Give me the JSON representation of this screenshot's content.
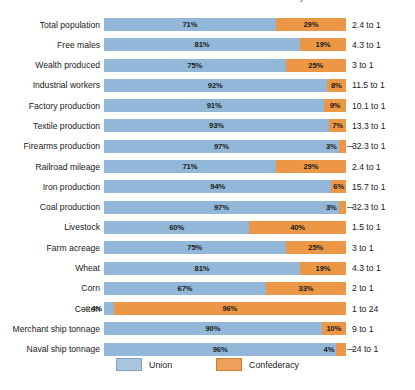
{
  "title": "Resources of the Union and the Confederacy",
  "legend": {
    "position": "bottom-center",
    "items": [
      {
        "label": "Union",
        "color": "#92b7d9",
        "key": "union"
      },
      {
        "label": "Confederacy",
        "color": "#eb9746",
        "key": "confederacy"
      }
    ]
  },
  "chart_data": {
    "type": "bar",
    "orientation": "horizontal",
    "stacked": true,
    "title": "Resources of the Union and the Confederacy",
    "xlabel": "",
    "ylabel": "",
    "xlim": [
      0,
      100
    ],
    "grid": false,
    "legend_position": "bottom-center",
    "value_unit": "percent",
    "categories": [
      "Total population",
      "Free males",
      "Wealth produced",
      "Industrial workers",
      "Factory production",
      "Textile production",
      "Firearms production",
      "Railroad mileage",
      "Iron production",
      "Coal production",
      "Livestock",
      "Farm acreage",
      "Wheat",
      "Corn",
      "Cotton",
      "Merchant ship tonnage",
      "Naval ship tonnage"
    ],
    "series": [
      {
        "name": "Union",
        "color": "#92b7d9",
        "values": [
          71,
          81,
          75,
          92,
          91,
          93,
          97,
          71,
          94,
          97,
          60,
          75,
          81,
          67,
          4,
          90,
          96
        ]
      },
      {
        "name": "Confederacy",
        "color": "#eb9746",
        "values": [
          29,
          19,
          25,
          8,
          9,
          7,
          3,
          29,
          6,
          3,
          40,
          25,
          19,
          33,
          96,
          10,
          4
        ]
      }
    ],
    "annotations": [
      "2.4 to 1",
      "4.3 to 1",
      "3 to 1",
      "11.5 to 1",
      "10.1 to 1",
      "13.3 to 1",
      "32.3 to 1",
      "2.4 to 1",
      "15.7 to 1",
      "32.3 to 1",
      "1.5 to 1",
      "3 to 1",
      "4.3 to 1",
      "2 to 1",
      "1 to 24",
      "9 to 1",
      "24 to 1"
    ]
  },
  "rows": [
    {
      "label": "Total population",
      "union": 71,
      "conf": 29,
      "union_label": "71%",
      "conf_label": "29%",
      "ratio": "2.4 to 1",
      "tiny": "none"
    },
    {
      "label": "Free males",
      "union": 81,
      "conf": 19,
      "union_label": "81%",
      "conf_label": "19%",
      "ratio": "4.3 to 1",
      "tiny": "none"
    },
    {
      "label": "Wealth produced",
      "union": 75,
      "conf": 25,
      "union_label": "75%",
      "conf_label": "25%",
      "ratio": "3 to 1",
      "tiny": "none"
    },
    {
      "label": "Industrial workers",
      "union": 92,
      "conf": 8,
      "union_label": "92%",
      "conf_label": "8%",
      "ratio": "11.5 to 1",
      "tiny": "none"
    },
    {
      "label": "Factory production",
      "union": 91,
      "conf": 9,
      "union_label": "91%",
      "conf_label": "9%",
      "ratio": "10.1 to 1",
      "tiny": "none"
    },
    {
      "label": "Textile production",
      "union": 93,
      "conf": 7,
      "union_label": "93%",
      "conf_label": "7%",
      "ratio": "13.3 to 1",
      "tiny": "none"
    },
    {
      "label": "Firearms production",
      "union": 97,
      "conf": 3,
      "union_label": "97%",
      "conf_label": "3%",
      "ratio": "32.3 to 1",
      "tiny": "conf"
    },
    {
      "label": "Railroad mileage",
      "union": 71,
      "conf": 29,
      "union_label": "71%",
      "conf_label": "29%",
      "ratio": "2.4 to 1",
      "tiny": "none"
    },
    {
      "label": "Iron production",
      "union": 94,
      "conf": 6,
      "union_label": "94%",
      "conf_label": "6%",
      "ratio": "15.7 to 1",
      "tiny": "none"
    },
    {
      "label": "Coal production",
      "union": 97,
      "conf": 3,
      "union_label": "97%",
      "conf_label": "3%",
      "ratio": "32.3 to 1",
      "tiny": "conf"
    },
    {
      "label": "Livestock",
      "union": 60,
      "conf": 40,
      "union_label": "60%",
      "conf_label": "40%",
      "ratio": "1.5 to 1",
      "tiny": "none"
    },
    {
      "label": "Farm acreage",
      "union": 75,
      "conf": 25,
      "union_label": "75%",
      "conf_label": "25%",
      "ratio": "3 to 1",
      "tiny": "none"
    },
    {
      "label": "Wheat",
      "union": 81,
      "conf": 19,
      "union_label": "81%",
      "conf_label": "19%",
      "ratio": "4.3 to 1",
      "tiny": "none"
    },
    {
      "label": "Corn",
      "union": 67,
      "conf": 33,
      "union_label": "67%",
      "conf_label": "33%",
      "ratio": "2 to 1",
      "tiny": "none"
    },
    {
      "label": "Cotton",
      "union": 4,
      "conf": 96,
      "union_label": "4%",
      "conf_label": "96%",
      "ratio": "1 to 24",
      "tiny": "union"
    },
    {
      "label": "Merchant ship tonnage",
      "union": 90,
      "conf": 10,
      "union_label": "90%",
      "conf_label": "10%",
      "ratio": "9 to 1",
      "tiny": "none"
    },
    {
      "label": "Naval ship tonnage",
      "union": 96,
      "conf": 4,
      "union_label": "96%",
      "conf_label": "4%",
      "ratio": "24 to 1",
      "tiny": "conf"
    }
  ]
}
